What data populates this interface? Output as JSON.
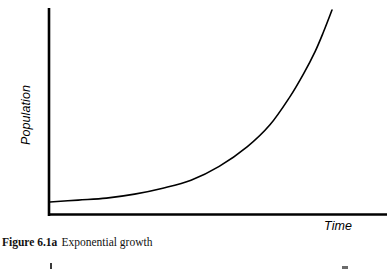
{
  "figure": {
    "caption_label": "Figure 6.1a",
    "caption_text": "Exponential growth",
    "background_color": "#ffffff",
    "ink_color": "#000000"
  },
  "chart_data": {
    "type": "line",
    "title": "Exponential growth",
    "xlabel": "Time",
    "ylabel": "Population",
    "grid": false,
    "legend": null,
    "axes": {
      "x_axis_visible": true,
      "y_axis_visible": true,
      "x_ticks": [],
      "y_ticks": [],
      "xlim": [
        0,
        1
      ],
      "ylim": [
        0,
        1
      ]
    },
    "series": [
      {
        "name": "Exponential growth",
        "color": "#000000",
        "line_width": 1.6,
        "x": [
          0.0,
          0.1,
          0.2,
          0.3,
          0.4,
          0.5,
          0.6,
          0.7,
          0.78,
          0.85,
          0.9,
          0.94,
          0.97,
          1.0
        ],
        "y": [
          0.03,
          0.04,
          0.05,
          0.07,
          0.1,
          0.14,
          0.21,
          0.31,
          0.42,
          0.56,
          0.68,
          0.79,
          0.89,
          1.0
        ]
      }
    ]
  }
}
